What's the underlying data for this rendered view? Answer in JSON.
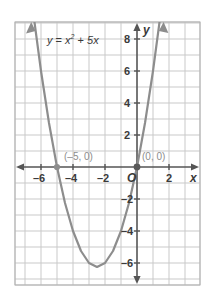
{
  "figure": {
    "name": "parabola-graph",
    "equation_label": {
      "lhs": "y",
      "eq": "=",
      "base": "x",
      "exp": "2",
      "plus": "+",
      "term": "5x"
    },
    "axis_names": {
      "x": "x",
      "y": "y"
    },
    "origin_label": "O",
    "point_labels": [
      {
        "text": "(–5, 0)",
        "x": -5,
        "y": 0
      },
      {
        "text": "(0, 0)",
        "x": 0,
        "y": 0
      }
    ],
    "colors": {
      "curve": "#8d8d8d",
      "axis": "#555555",
      "grid": "#c9c9c9",
      "border": "#b0b0b0",
      "text": "#3a3a3a",
      "point_text": "#8d8d8d",
      "background": "#ffffff"
    }
  },
  "chart_data": {
    "type": "line",
    "title": "",
    "equation": "y = x^2 + 5x",
    "equation_display": "y = x² + 5x",
    "xlabel": "x",
    "ylabel": "y",
    "xlim": [
      -7.5,
      4.0
    ],
    "ylim": [
      -9.0,
      9.0
    ],
    "grid": true,
    "x_ticks": [
      -6,
      -4,
      -2,
      2
    ],
    "x_tick_labels": [
      "–6",
      "–4",
      "–2",
      "2"
    ],
    "y_ticks": [
      8,
      6,
      4,
      2,
      -2,
      -4,
      -6
    ],
    "y_tick_labels": [
      "8",
      "6",
      "4",
      "2",
      "–2",
      "–4",
      "–6"
    ],
    "tick_step": 1,
    "labeled_tick_step": 2,
    "vertex": [
      -2.5,
      -6.25
    ],
    "roots": [
      -5,
      0
    ],
    "annotations": [
      {
        "text": "y = x² + 5x",
        "x": -5.2,
        "y": 8.0
      },
      {
        "text": "(–5, 0)",
        "x": -4.6,
        "y": 1.0
      },
      {
        "text": "(0, 0)",
        "x": 0.35,
        "y": 1.0
      },
      {
        "text": "O",
        "x": -0.55,
        "y": -0.85
      }
    ],
    "series": [
      {
        "name": "y = x² + 5x",
        "color": "#8d8d8d",
        "x": [
          -7.3,
          -7.0,
          -6.5,
          -6.0,
          -5.5,
          -5.0,
          -4.5,
          -4.0,
          -3.5,
          -3.0,
          -2.5,
          -2.0,
          -1.5,
          -1.0,
          -0.5,
          0.0,
          0.5,
          1.0,
          1.5,
          1.8
        ],
        "values": [
          16.79,
          14.0,
          9.75,
          6.0,
          2.75,
          0.0,
          -2.25,
          -4.0,
          -5.25,
          -6.0,
          -6.25,
          -6.0,
          -5.25,
          -4.0,
          -2.25,
          0.0,
          2.75,
          6.0,
          9.75,
          12.24
        ]
      }
    ],
    "markers": [
      {
        "x": -5,
        "y": 0
      },
      {
        "x": 0,
        "y": 0
      }
    ]
  }
}
